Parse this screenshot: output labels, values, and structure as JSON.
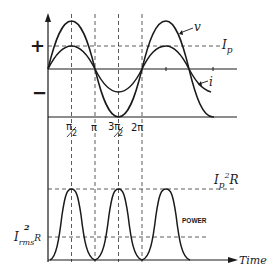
{
  "figure": {
    "top_graph": {
      "plus_sign": "+",
      "minus_sign": "−",
      "curve_v_label": "v",
      "curve_i_label": "i",
      "peak_current_label": "I",
      "peak_current_sub": "p",
      "x_ticks": [
        {
          "label": "π/2",
          "num": "π",
          "den": "2"
        },
        {
          "label": "π"
        },
        {
          "label": "3π/2",
          "num": "3π",
          "den": "2"
        },
        {
          "label": "2π"
        }
      ]
    },
    "bottom_graph": {
      "peak_power_label": "I",
      "peak_power_sub": "p",
      "peak_power_sup": "2",
      "peak_power_tail": "R",
      "rms_power_label": "I",
      "rms_power_sub": "rms",
      "rms_power_sup": "2",
      "rms_power_tail": "R",
      "curve_label": "POWER",
      "x_axis_label": "Time"
    },
    "colors": {
      "ink": "#1a1a1a",
      "background": "#ffffff"
    }
  }
}
